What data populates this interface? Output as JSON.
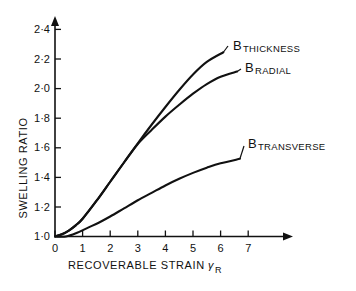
{
  "chart_data": {
    "type": "line",
    "title": "",
    "xlabel": "RECOVERABLE  STRAIN γR",
    "xlabel_text": "RECOVERABLE  STRAIN",
    "xlabel_symbol": "γ",
    "xlabel_symbol_sub": "R",
    "ylabel": "SWELLING  RATIO",
    "xlim": [
      0,
      7.4
    ],
    "ylim": [
      1.0,
      2.45
    ],
    "grid": false,
    "legend": "inline-end-labels",
    "x_ticks": [
      "0",
      "1",
      "2",
      "3",
      "4",
      "5",
      "6",
      "7"
    ],
    "x_tick_values": [
      0,
      1,
      2,
      3,
      4,
      5,
      6,
      7
    ],
    "y_ticks": [
      "1·0",
      "1·2",
      "1·4",
      "1·6",
      "1·8",
      "2·0",
      "2·2",
      "2·4"
    ],
    "y_tick_values": [
      1.0,
      1.2,
      1.4,
      1.6,
      1.8,
      2.0,
      2.2,
      2.4
    ],
    "series": [
      {
        "name": "B THICKNESS",
        "label_main": "B",
        "label_sub": "THICKNESS",
        "x": [
          0,
          0.25,
          0.5,
          0.75,
          1.0,
          1.5,
          2.0,
          2.5,
          3.0,
          3.5,
          4.0,
          4.5,
          5.0,
          5.5,
          6.1
        ],
        "y": [
          1.0,
          1.015,
          1.04,
          1.075,
          1.12,
          1.24,
          1.37,
          1.5,
          1.63,
          1.755,
          1.875,
          1.99,
          2.095,
          2.18,
          2.245
        ]
      },
      {
        "name": "B RADIAL",
        "label_main": "B",
        "label_sub": "RADIAL",
        "x": [
          0,
          0.25,
          0.5,
          0.75,
          1.0,
          1.5,
          2.0,
          2.5,
          3.0,
          3.5,
          4.0,
          4.5,
          5.0,
          5.5,
          6.0,
          6.6
        ],
        "y": [
          1.0,
          1.015,
          1.04,
          1.075,
          1.12,
          1.24,
          1.37,
          1.5,
          1.625,
          1.72,
          1.81,
          1.89,
          1.965,
          2.03,
          2.08,
          2.115
        ]
      },
      {
        "name": "B TRANSVERSE",
        "label_main": "B",
        "label_sub": "TRANSVERSE",
        "x": [
          0,
          0.4,
          0.8,
          1.2,
          1.6,
          2.0,
          2.5,
          3.0,
          3.5,
          4.0,
          4.5,
          5.0,
          5.5,
          6.0,
          6.7
        ],
        "y": [
          1.0,
          1.0,
          1.025,
          1.06,
          1.095,
          1.135,
          1.19,
          1.245,
          1.295,
          1.345,
          1.39,
          1.43,
          1.465,
          1.495,
          1.525
        ]
      }
    ],
    "annotations": [
      {
        "name": "label-thickness",
        "main": "B",
        "sub": "THICKNESS"
      },
      {
        "name": "label-radial",
        "main": "B",
        "sub": "RADIAL"
      },
      {
        "name": "label-transverse",
        "main": "B",
        "sub": "TRANSVERSE"
      }
    ],
    "colors": {
      "line": "#111111",
      "axis": "#111111",
      "background": "#ffffff"
    }
  }
}
